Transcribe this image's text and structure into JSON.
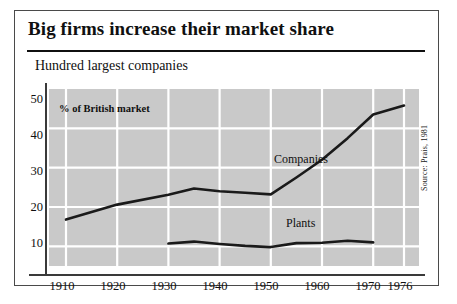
{
  "figure": {
    "title": "Big firms increase their market share",
    "subtitle": "Hundred largest companies",
    "inplot_note": "% of British market",
    "source": "Source: Prais, 1981"
  },
  "chart_data": {
    "type": "line",
    "title": "Big firms increase their market share",
    "subtitle": "Hundred largest companies",
    "xlabel": "",
    "ylabel": "% of British market",
    "xlim": [
      1910,
      1976
    ],
    "ylim": [
      5,
      50
    ],
    "grid": true,
    "legend_position": "inline-labels",
    "x_ticks": [
      "1910",
      "1920",
      "1930",
      "1940",
      "1950",
      "1960",
      "1970",
      "1976"
    ],
    "y_ticks": [
      "10",
      "20",
      "30",
      "40",
      "50"
    ],
    "annotations": [
      "% of British market",
      "Companies",
      "Plants"
    ],
    "series": [
      {
        "name": "Companies",
        "x": [
          1910,
          1920,
          1930,
          1935,
          1940,
          1945,
          1950,
          1955,
          1960,
          1965,
          1970,
          1976
        ],
        "values": [
          16.8,
          20.6,
          23.1,
          24.7,
          24.0,
          23.6,
          23.2,
          27.5,
          32.0,
          37.5,
          43.5,
          45.8
        ]
      },
      {
        "name": "Plants",
        "x": [
          1930,
          1935,
          1940,
          1945,
          1950,
          1955,
          1960,
          1965,
          1970
        ],
        "values": [
          10.7,
          11.2,
          10.6,
          10.1,
          9.8,
          10.8,
          10.9,
          11.4,
          11.0
        ]
      }
    ]
  },
  "axes": {
    "y_ticks": [
      {
        "label": "50",
        "value": 50
      },
      {
        "label": "40",
        "value": 40
      },
      {
        "label": "30",
        "value": 30
      },
      {
        "label": "20",
        "value": 20
      },
      {
        "label": "10",
        "value": 10
      }
    ],
    "x_ticks": [
      {
        "label": "1910",
        "value": 1910
      },
      {
        "label": "1920",
        "value": 1920
      },
      {
        "label": "1930",
        "value": 1930
      },
      {
        "label": "1940",
        "value": 1940
      },
      {
        "label": "1950",
        "value": 1950
      },
      {
        "label": "1960",
        "value": 1960
      },
      {
        "label": "1970",
        "value": 1970
      },
      {
        "label": "1976",
        "value": 1976
      }
    ]
  },
  "labels": {
    "companies": "Companies",
    "plants": "Plants"
  },
  "colors": {
    "plot_background": "#c9c9c9",
    "gridline": "#ffffff",
    "line": "#1a1a1a",
    "axis": "#3a3a3a",
    "frame": "#4a4a4a",
    "text": "#101010"
  }
}
